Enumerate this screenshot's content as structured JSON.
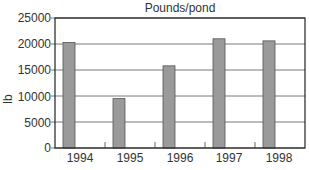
{
  "chart_data": {
    "type": "bar",
    "title": "Pounds/pond",
    "xlabel": "",
    "ylabel": "lb",
    "categories": [
      "1994",
      "1995",
      "1996",
      "1997",
      "1998"
    ],
    "values": [
      20300,
      9500,
      15800,
      21000,
      20600
    ],
    "ylim": [
      0,
      25000
    ],
    "yticks": [
      "0",
      "5000",
      "10000",
      "15000",
      "20000",
      "25000"
    ],
    "grid": true,
    "legend": null,
    "bar_color": "#9a9a9a",
    "bar_edge_color": "#555555"
  }
}
